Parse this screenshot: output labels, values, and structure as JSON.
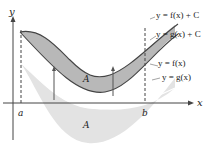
{
  "diagram": {
    "axes": {
      "x_label": "x",
      "y_label": "y"
    },
    "bounds": {
      "left": "a",
      "right": "b"
    },
    "curves": [
      {
        "id": "f_plus_c",
        "label": "y = f(x) + C"
      },
      {
        "id": "g_plus_c",
        "label": "y = g(x) + C"
      },
      {
        "id": "f",
        "label": "y = f(x)"
      },
      {
        "id": "g",
        "label": "y = g(x)"
      }
    ],
    "regions": [
      {
        "id": "upper",
        "label": "A",
        "fill": "#b8b8b8"
      },
      {
        "id": "lower",
        "label": "A",
        "fill": "#e3e3e3"
      }
    ],
    "colors": {
      "axis": "#444444",
      "curve": "#555555",
      "upper_fill": "#b8b8b8",
      "lower_fill": "#e3e3e3",
      "text": "#222222"
    }
  }
}
